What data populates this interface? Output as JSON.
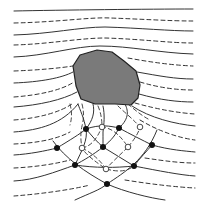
{
  "diagram": {
    "width": 206,
    "height": 213,
    "colors": {
      "background": "#ffffff",
      "line": "#333333",
      "obstacle_fill": "#7a7a7a",
      "obstacle_stroke": "#222222",
      "node_fill": "#111111",
      "open_node_fill": "#ffffff"
    },
    "obstacle": {
      "points": "73,66 80,55 97,50 112,52 124,61 136,71 140,85 138,98 131,105 115,104 95,104 81,99 76,86"
    },
    "flow_lines": [
      {
        "style": "solid",
        "d": "M14,11 C60,10 150,9 193,9"
      },
      {
        "style": "dashed",
        "d": "M14,23 C60,22 90,17 110,18 C140,19 170,21 193,21"
      },
      {
        "style": "solid",
        "d": "M14,35 C50,34 80,27 105,27 C140,28 170,31 193,31"
      },
      {
        "style": "dashed",
        "d": "M14,45 C50,44 80,38 105,38 C140,39 170,43 193,43"
      },
      {
        "style": "solid",
        "d": "M14,57 C45,56 75,46 100,46 C130,46 160,53 193,54"
      },
      {
        "style": "dashed",
        "d": "M14,71 C40,70 60,68 73,66"
      },
      {
        "style": "dashed",
        "d": "M128,58 C150,62 170,65 193,66"
      },
      {
        "style": "solid",
        "d": "M14,83 C40,82 62,78 73,72"
      },
      {
        "style": "solid",
        "d": "M137,72 C160,76 175,79 193,79"
      },
      {
        "style": "dashed",
        "d": "M14,97 C40,95 62,90 74,82"
      },
      {
        "style": "dashed",
        "d": "M140,82 C160,88 178,90 193,90"
      },
      {
        "style": "solid",
        "d": "M14,107 C40,105 62,100 77,92"
      },
      {
        "style": "solid",
        "d": "M139,94 C160,100 178,102 193,102"
      },
      {
        "style": "dashed",
        "d": "M14,120 C40,118 60,112 72,104"
      },
      {
        "style": "dashed",
        "d": "M135,103 C160,110 180,113 195,114"
      },
      {
        "style": "solid",
        "d": "M14,132 C40,130 62,124 78,104"
      },
      {
        "style": "solid",
        "d": "M132,106 C150,118 175,124 195,126"
      },
      {
        "style": "dashed",
        "d": "M14,144 C35,143 55,140 70,132"
      },
      {
        "style": "dashed",
        "d": "M140,120 C160,132 180,138 195,140"
      },
      {
        "style": "solid",
        "d": "M14,155 C30,154 45,151 57,148"
      },
      {
        "style": "solid",
        "d": "M152,145 C170,150 185,151 195,152"
      },
      {
        "style": "dashed",
        "d": "M14,168 C35,167 55,164 70,160"
      },
      {
        "style": "dashed",
        "d": "M145,158 C165,161 180,163 195,163"
      },
      {
        "style": "solid",
        "d": "M14,181 C35,180 55,172 75,165"
      },
      {
        "style": "solid",
        "d": "M134,166 C160,171 180,175 195,176"
      },
      {
        "style": "dashed",
        "d": "M14,196 C40,194 70,190 90,185"
      },
      {
        "style": "dashed",
        "d": "M125,180 C150,184 175,187 195,188"
      }
    ],
    "grid_lines": [
      {
        "style": "solid",
        "d": "M53,141 C65,158 85,172 107,184 C125,192 150,198 165,200"
      },
      {
        "style": "solid",
        "d": "M75,200 C90,193 100,190 107,184 C125,172 145,160 157,130"
      },
      {
        "style": "solid",
        "d": "M75,165 C82,150 88,140 86,129 C84,118 80,110 78,104"
      },
      {
        "style": "solid",
        "d": "M75,165 C95,168 115,168 134,166"
      },
      {
        "style": "solid",
        "d": "M57,148 C70,140 80,134 86,129 C100,124 110,126 119,128 C130,118 128,110 125,104"
      },
      {
        "style": "solid",
        "d": "M86,129 C92,136 97,142 103,147 C112,140 116,134 119,128"
      },
      {
        "style": "solid",
        "d": "M103,147 C113,153 124,160 134,166 C140,158 147,151 152,145"
      },
      {
        "style": "solid",
        "d": "M119,128 C130,134 142,140 152,145"
      },
      {
        "style": "solid",
        "d": "M103,147 C93,155 84,160 75,165"
      },
      {
        "style": "solid",
        "d": "M93,104 C95,112 93,120 86,129"
      },
      {
        "style": "solid",
        "d": "M103,106 C105,115 104,124 103,132 C103,138 103,142 103,147"
      }
    ],
    "dashed_grid_lines": [
      {
        "style": "dashed",
        "d": "M82,104 C84,112 84,118 82,126 C80,135 81,142 82,148 C86,155 96,162 106,169 C118,172 126,172 134,166"
      },
      {
        "style": "dashed",
        "d": "M98,106 C101,113 102,120 102,127 C110,128 118,132 128,147 C120,155 112,162 106,169"
      },
      {
        "style": "dashed",
        "d": "M118,106 C124,112 132,118 140,127 C138,135 132,142 128,147"
      },
      {
        "style": "dashed",
        "d": "M82,148 C92,146 97,138 102,127"
      },
      {
        "style": "dashed",
        "d": "M106,169 C100,160 92,153 82,148"
      },
      {
        "style": "dashed",
        "d": "M70,104 C72,112 72,118 70,125"
      },
      {
        "style": "dashed",
        "d": "M128,104 C135,110 142,116 150,120"
      }
    ],
    "filled_nodes": [
      {
        "x": 86,
        "y": 129
      },
      {
        "x": 119,
        "y": 128
      },
      {
        "x": 57,
        "y": 148
      },
      {
        "x": 103,
        "y": 147
      },
      {
        "x": 152,
        "y": 145
      },
      {
        "x": 75,
        "y": 165
      },
      {
        "x": 134,
        "y": 166
      },
      {
        "x": 107,
        "y": 184
      }
    ],
    "open_nodes": [
      {
        "x": 102,
        "y": 127
      },
      {
        "x": 140,
        "y": 127
      },
      {
        "x": 82,
        "y": 148
      },
      {
        "x": 128,
        "y": 147
      },
      {
        "x": 106,
        "y": 169
      }
    ]
  }
}
